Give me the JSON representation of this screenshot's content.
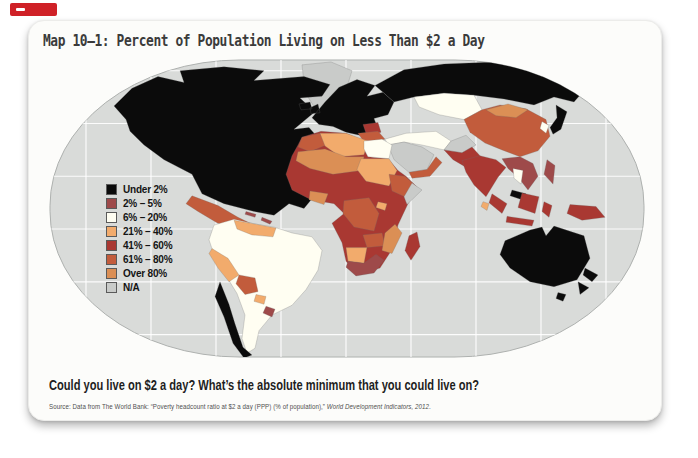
{
  "colors": {
    "page_bg": "#ffffff",
    "card_bg": "#fcfcfa",
    "tab_red": "#cf2127",
    "title": "#3b3b3b",
    "text_dark": "#1e1e1e",
    "source": "#4f4f4f",
    "ocean": "#d9dbd9",
    "map_border": "#adb0ae",
    "graticule": "#ffffff",
    "swatch_border": "#5a5a5a"
  },
  "palette": {
    "under2": "#0b0b0b",
    "p2_5": "#9e4a4a",
    "p6_20": "#fffef2",
    "p21_40": "#f2ab6c",
    "p41_60": "#a93832",
    "p61_80": "#c25c3c",
    "over80": "#db8f55",
    "na": "#c9cbc9"
  },
  "header": {
    "title": "Map 10–1: Percent of Population Living on Less Than $2 a Day"
  },
  "legend": {
    "items": [
      {
        "label": "Under 2%",
        "palette": "under2"
      },
      {
        "label": "2% – 5%",
        "palette": "p2_5"
      },
      {
        "label": "6% – 20%",
        "palette": "p6_20"
      },
      {
        "label": "21% – 40%",
        "palette": "p21_40"
      },
      {
        "label": "41% – 60%",
        "palette": "p41_60"
      },
      {
        "label": "61% – 80%",
        "palette": "p61_80"
      },
      {
        "label": "Over 80%",
        "palette": "over80"
      },
      {
        "label": "N/A",
        "palette": "na"
      }
    ]
  },
  "map": {
    "type": "choropleth-world",
    "projection": "robinson",
    "regions": [
      {
        "id": "greenland",
        "palette": "na"
      },
      {
        "id": "north-america",
        "palette": "under2"
      },
      {
        "id": "mexico-central-america",
        "palette": "p61_80"
      },
      {
        "id": "caribbean",
        "palette": "p2_5"
      },
      {
        "id": "south-america-body",
        "palette": "p6_20"
      },
      {
        "id": "venezuela-guyanas",
        "palette": "p21_40"
      },
      {
        "id": "peru",
        "palette": "p21_40"
      },
      {
        "id": "bolivia",
        "palette": "p61_80"
      },
      {
        "id": "paraguay",
        "palette": "p21_40"
      },
      {
        "id": "chile",
        "palette": "under2"
      },
      {
        "id": "uruguay",
        "palette": "p2_5"
      },
      {
        "id": "europe",
        "palette": "under2"
      },
      {
        "id": "balkans",
        "palette": "p41_60"
      },
      {
        "id": "russia",
        "palette": "under2"
      },
      {
        "id": "central-asia",
        "palette": "p6_20"
      },
      {
        "id": "turkey",
        "palette": "p61_80"
      },
      {
        "id": "iran-iraq",
        "palette": "p6_20"
      },
      {
        "id": "saudi-arabia",
        "palette": "na"
      },
      {
        "id": "yemen-oman",
        "palette": "p61_80"
      },
      {
        "id": "afghanistan",
        "palette": "na"
      },
      {
        "id": "pakistan",
        "palette": "p41_60"
      },
      {
        "id": "india",
        "palette": "p41_60"
      },
      {
        "id": "sri-lanka",
        "palette": "p21_40"
      },
      {
        "id": "china",
        "palette": "p61_80"
      },
      {
        "id": "mongolia",
        "palette": "over80"
      },
      {
        "id": "korea",
        "palette": "p6_20"
      },
      {
        "id": "japan",
        "palette": "under2"
      },
      {
        "id": "mainland-se-asia",
        "palette": "p2_5"
      },
      {
        "id": "thailand",
        "palette": "p6_20"
      },
      {
        "id": "malaysia",
        "palette": "under2"
      },
      {
        "id": "philippines",
        "palette": "p2_5"
      },
      {
        "id": "sumatra",
        "palette": "p41_60"
      },
      {
        "id": "java",
        "palette": "p41_60"
      },
      {
        "id": "borneo",
        "palette": "p41_60"
      },
      {
        "id": "sulawesi",
        "palette": "p41_60"
      },
      {
        "id": "new-guinea",
        "palette": "p41_60"
      },
      {
        "id": "africa-base",
        "palette": "p41_60"
      },
      {
        "id": "morocco",
        "palette": "p61_80"
      },
      {
        "id": "algeria-libya",
        "palette": "p21_40"
      },
      {
        "id": "egypt",
        "palette": "p6_20"
      },
      {
        "id": "sahel",
        "palette": "over80"
      },
      {
        "id": "sudan-chad",
        "palette": "p21_40"
      },
      {
        "id": "ethiopia",
        "palette": "p61_80"
      },
      {
        "id": "somalia",
        "palette": "na"
      },
      {
        "id": "ghana-ivory",
        "palette": "over80"
      },
      {
        "id": "congo-basin",
        "palette": "p61_80"
      },
      {
        "id": "uganda",
        "palette": "p21_40"
      },
      {
        "id": "zambia-zimbabwe",
        "palette": "p61_80"
      },
      {
        "id": "namibia-botswana",
        "palette": "p21_40"
      },
      {
        "id": "south-africa",
        "palette": "p2_5"
      },
      {
        "id": "mozambique",
        "palette": "over80"
      },
      {
        "id": "madagascar",
        "palette": "p41_60"
      },
      {
        "id": "australia",
        "palette": "under2"
      },
      {
        "id": "tasmania",
        "palette": "under2"
      },
      {
        "id": "new-zealand",
        "palette": "under2"
      }
    ]
  },
  "footer": {
    "question": "Could you live on $2 a day? What’s the absolute minimum that you could live on?",
    "source_prefix": "Source: Data from The World Bank: “Poverty headcount ratio at $2 a day (PPP) (% of population),” ",
    "source_italic": "World Development Indicators, 2012",
    "source_suffix": "."
  }
}
